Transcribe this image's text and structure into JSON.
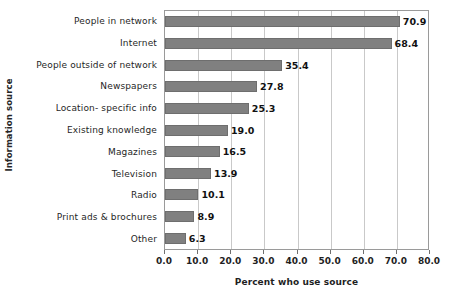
{
  "chart_data": {
    "type": "bar",
    "orientation": "horizontal",
    "title": "",
    "xlabel": "Percent who use source",
    "ylabel": "Information source",
    "xlim": [
      0.0,
      80.0
    ],
    "xticks": [
      "0.0",
      "10.0",
      "20.0",
      "30.0",
      "40.0",
      "50.0",
      "60.0",
      "70.0",
      "80.0"
    ],
    "grid": "vertical",
    "legend": "none",
    "bar_color": "#808080",
    "categories": [
      "People in network",
      "Internet",
      "People outside of network",
      "Newspapers",
      "Location- specific info",
      "Existing knowledge",
      "Magazines",
      "Television",
      "Radio",
      "Print ads & brochures",
      "Other"
    ],
    "values": [
      70.9,
      68.4,
      35.4,
      27.8,
      25.3,
      19.0,
      16.5,
      13.9,
      10.1,
      8.9,
      6.3
    ],
    "value_labels": [
      "70.9",
      "68.4",
      "35.4",
      "27.8",
      "25.3",
      "19.0",
      "16.5",
      "13.9",
      "10.1",
      "8.9",
      "6.3"
    ]
  }
}
